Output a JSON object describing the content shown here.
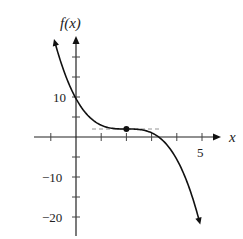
{
  "chart_data": {
    "type": "line",
    "title": "",
    "xlabel": "x",
    "ylabel": "f(x)",
    "xlim": [
      -1,
      5.5
    ],
    "ylim": [
      -24,
      26
    ],
    "x_ticks": [
      -1,
      0,
      1,
      2,
      3,
      4,
      5
    ],
    "x_tick_labels": [
      {
        "value": 5,
        "label": "5"
      }
    ],
    "y_ticks": [
      -20,
      -15,
      -10,
      -5,
      0,
      5,
      10,
      15,
      20
    ],
    "y_tick_labels": [
      {
        "value": 10,
        "label": "10"
      },
      {
        "value": -10,
        "label": "−10"
      },
      {
        "value": -20,
        "label": "−20"
      }
    ],
    "grid": false,
    "series": [
      {
        "name": "f(x)",
        "description": "Decreasing cubic with a horizontal inflection point at (2, 2)",
        "x": [
          -0.87,
          -0.5,
          0,
          0.5,
          1,
          1.5,
          2,
          2.5,
          3,
          3.5,
          4,
          4.5,
          4.92
        ],
        "y": [
          24.2,
          16.8,
          9.6,
          5.2,
          3.0,
          2.1,
          2.0,
          1.9,
          1.0,
          -1.2,
          -5.6,
          -12.8,
          -22.5
        ]
      }
    ],
    "annotations": [
      {
        "type": "point",
        "x": 2,
        "y": 2,
        "label": "inflection point"
      },
      {
        "type": "dashed_tangent_line",
        "y": 2,
        "x_from": 0.8,
        "x_to": 3.3
      }
    ]
  },
  "labels": {
    "y_axis": "f(x)",
    "x_axis": "x",
    "tick_5": "5",
    "tick_10": "10",
    "tick_neg10": "−10",
    "tick_neg20": "−20"
  }
}
